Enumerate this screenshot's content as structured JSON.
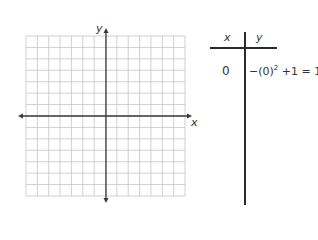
{
  "chart_data": {
    "type": "table",
    "graph": {
      "grid": true,
      "x_axis_label": "x",
      "y_axis_label": "y",
      "columns": 14,
      "rows": 14,
      "xlim": [
        -7,
        7
      ],
      "ylim": [
        -7,
        7
      ],
      "tick_labels": []
    },
    "table": {
      "headers": [
        "x",
        "y"
      ],
      "rows": [
        {
          "x": "0",
          "y_expr_prefix": "−(0)",
          "y_expr_exp": "2",
          "y_expr_suffix": " +1 = 1"
        }
      ]
    }
  },
  "labels": {
    "x_axis": "x",
    "y_axis": "y"
  },
  "table": {
    "header_x": "x",
    "header_y": "y",
    "row0_x": "0",
    "row0_y_prefix": "−(0)",
    "row0_y_exp": "2",
    "row0_y_suffix": " +1 = 1"
  },
  "colors": {
    "grid": "#bdbdbd",
    "axis": "#333333",
    "table_lines": "#2a2a2a"
  }
}
